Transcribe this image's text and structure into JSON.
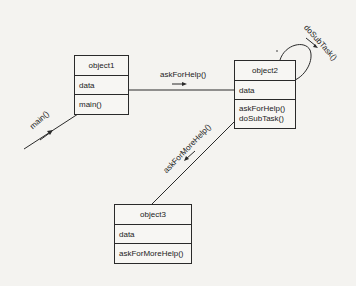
{
  "objects": {
    "object1": {
      "name": "object1",
      "attribute": "data",
      "methods": [
        "main()"
      ]
    },
    "object2": {
      "name": "object2",
      "attribute": "data",
      "methods": [
        "askForHelp()",
        "doSubTask()"
      ]
    },
    "object3": {
      "name": "object3",
      "attribute": "data",
      "methods": [
        "askForMoreHelp()"
      ]
    }
  },
  "messages": {
    "main": "main()",
    "askForHelp": "askForHelp()",
    "doSubTask": "doSubTask()",
    "askForMoreHelp": "askForMoreHelp()"
  },
  "colors": {
    "line": "#2a2a2a",
    "background": "#f4f3f0"
  }
}
